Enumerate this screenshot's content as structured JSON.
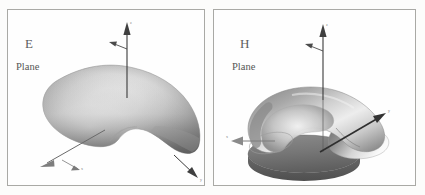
{
  "figure": {
    "title_visible": false,
    "background_color": "#fcfcfb",
    "panel_border_color": "#a9a9a5",
    "panels": [
      {
        "id": "e-plane",
        "plane_code": "E",
        "plane_word": "Plane",
        "shape": "kidney-lobe-radiation-pattern",
        "shading": "grayscale-gradient",
        "axes": [
          {
            "name": "vertical-axis",
            "label": "z",
            "direction": "up"
          },
          {
            "name": "left-axis",
            "label": "x",
            "direction": "down-left"
          },
          {
            "name": "right-axis",
            "label": "y",
            "direction": "down-right"
          }
        ]
      },
      {
        "id": "h-plane",
        "plane_code": "H",
        "plane_word": "Plane",
        "shape": "toroidal-dome-radiation-pattern",
        "shading": "grayscale-gradient",
        "axes": [
          {
            "name": "vertical-axis",
            "label": "z",
            "direction": "up"
          },
          {
            "name": "left-axis",
            "label": "x",
            "direction": "left"
          },
          {
            "name": "right-axis",
            "label": "y",
            "direction": "up-right"
          }
        ]
      }
    ]
  },
  "colors": {
    "surface_light": "#fdfdfd",
    "surface_mid": "#b4b4b4",
    "surface_dark": "#6d6d6d",
    "surface_darkest": "#4a4a4a",
    "axis_line": "#3a3a3a",
    "text": "#5d5d5d"
  }
}
